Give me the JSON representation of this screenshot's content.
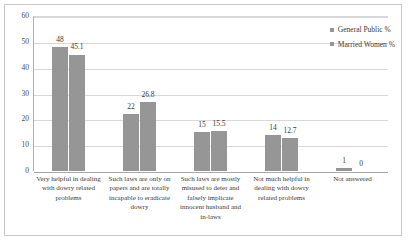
{
  "chart_data": {
    "type": "bar",
    "title": "",
    "xlabel": "",
    "ylabel": "",
    "ylim": [
      0,
      60
    ],
    "yticks": [
      0,
      10,
      20,
      30,
      40,
      50,
      60
    ],
    "grid": true,
    "legend_position": "top-right",
    "categories": [
      "Very helpful in dealing with dowry related problems",
      "Such laws are only on papers and are totally incapable to eradicate dowry",
      "Such laws are mostly misused to deter and falsely implicate innocent husband and in-laws",
      "Not much  helpful in dealing with dowry related problems",
      "Not answered"
    ],
    "series": [
      {
        "name": "General Public %",
        "color": "#969696",
        "values": [
          48,
          22,
          15,
          14,
          1
        ],
        "labels": [
          "48",
          "22",
          "15",
          "14",
          "1"
        ]
      },
      {
        "name": "Married Women %",
        "color": "#969696",
        "values": [
          45.1,
          26.8,
          15.5,
          12.7,
          0
        ],
        "labels": [
          "45.1",
          "26.8",
          "15.5",
          "12.7",
          "0"
        ]
      }
    ]
  },
  "legend": {
    "items": [
      {
        "label": "General Public %",
        "color": "#969696"
      },
      {
        "label": "Married Women %",
        "color": "#969696"
      }
    ]
  }
}
